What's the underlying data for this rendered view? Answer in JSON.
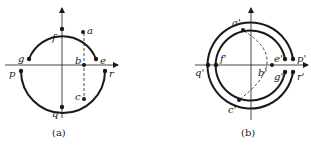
{
  "colors": {
    "ink": "#1a1a1a",
    "background": "#ffffff"
  },
  "panel_a": {
    "caption": "(a)",
    "points": {
      "a": "a",
      "b": "b",
      "c": "c",
      "e": "e",
      "f": "f",
      "g": "g",
      "p": "p",
      "q": "q",
      "r": "r"
    }
  },
  "panel_b": {
    "caption": "(b)",
    "points": {
      "a": "a'",
      "b": "b'",
      "c": "c'",
      "e": "e'",
      "f": "f'",
      "g": "g'",
      "p": "p'",
      "q": "q'",
      "r": "r'"
    }
  }
}
